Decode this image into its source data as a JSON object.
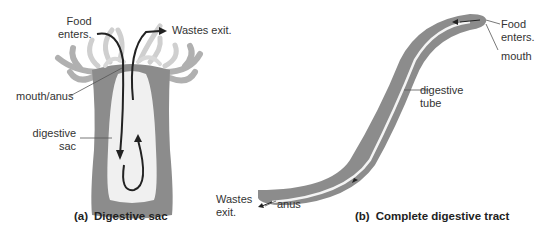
{
  "panel_a": {
    "caption_tag": "(a)",
    "caption": "Digestive sac",
    "labels": {
      "food_enters_1": "Food",
      "food_enters_2": "enters.",
      "wastes_exit": "Wastes exit.",
      "mouth_anus": "mouth/anus",
      "digestive_sac_1": "digestive",
      "digestive_sac_2": "sac"
    }
  },
  "panel_b": {
    "caption_tag": "(b)",
    "caption": "Complete digestive tract",
    "labels": {
      "food_enters_1": "Food",
      "food_enters_2": "enters.",
      "mouth": "mouth",
      "digestive_tube_1": "digestive",
      "digestive_tube_2": "tube",
      "wastes_exit_1": "Wastes",
      "wastes_exit_2": "exit.",
      "anus": "anus"
    }
  },
  "colors": {
    "body_outer": "#8c8c8c",
    "body_inner": "#f2f2f2",
    "tentacle": "#c8c8c8",
    "arrow": "#2a2a2a",
    "leader": "#555555"
  }
}
